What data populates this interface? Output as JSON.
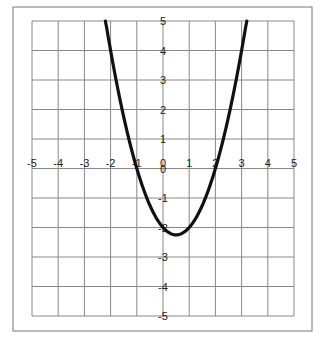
{
  "chart_data": {
    "type": "line",
    "title": "",
    "xlabel": "",
    "ylabel": "",
    "xlim": [
      -5,
      5
    ],
    "ylim": [
      -5,
      5
    ],
    "grid": true,
    "x_ticks": [
      -5,
      -4,
      -3,
      -2,
      -1,
      0,
      1,
      2,
      3,
      4,
      5
    ],
    "y_ticks": [
      -5,
      -4,
      -3,
      -2,
      -1,
      0,
      1,
      2,
      3,
      4,
      5
    ],
    "x_tick_labels": [
      "-5",
      "-4",
      "-3",
      "-2",
      "-1",
      "0",
      "1",
      "2",
      "3",
      "4",
      "5"
    ],
    "y_tick_labels": [
      "5",
      "4",
      "3",
      "2",
      "1",
      "0",
      "-1",
      "-2",
      "-3",
      "-4",
      "-5"
    ],
    "series": [
      {
        "name": "y = x^2 - x - 2",
        "x": [
          -2.2,
          -2,
          -1.5,
          -1,
          -0.5,
          0,
          0.5,
          1,
          1.5,
          2,
          2.5,
          3,
          3.2
        ],
        "y": [
          5.04,
          4,
          1.75,
          0,
          -1.25,
          -2,
          -2.25,
          -2,
          -1.25,
          0,
          1.75,
          4,
          5.04
        ]
      }
    ],
    "legend": null
  },
  "colors": {
    "curve": "#111111",
    "grid": "#888888",
    "frame": "#777777"
  }
}
